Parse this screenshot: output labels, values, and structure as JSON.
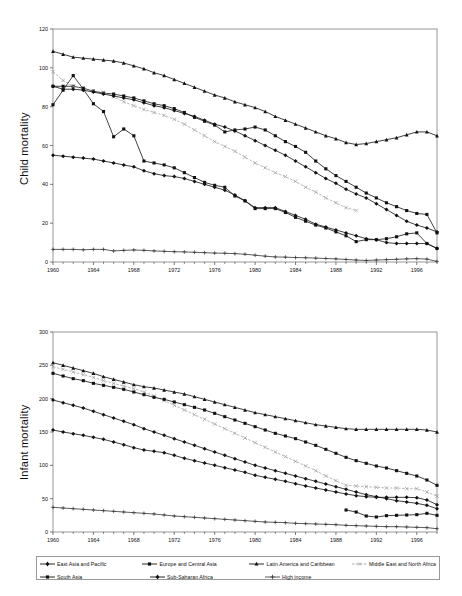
{
  "chart_data": [
    {
      "type": "line",
      "id": "child-mortality",
      "title": "",
      "ylabel": "Child mortality",
      "xlabel": "",
      "ylim": [
        0,
        120
      ],
      "ytick_step": 20,
      "yticks": [
        0,
        20,
        40,
        60,
        80,
        100,
        120
      ],
      "xlim": [
        1960,
        1998
      ],
      "xticks": [
        1960,
        1964,
        1968,
        1972,
        1976,
        1980,
        1984,
        1988,
        1992,
        1996
      ],
      "grid": false,
      "legend_position": "bottom",
      "x": [
        1960,
        1961,
        1962,
        1963,
        1964,
        1965,
        1966,
        1967,
        1968,
        1969,
        1970,
        1971,
        1972,
        1973,
        1974,
        1975,
        1976,
        1977,
        1978,
        1979,
        1980,
        1981,
        1982,
        1983,
        1984,
        1985,
        1986,
        1987,
        1988,
        1989,
        1990,
        1991,
        1992,
        1993,
        1994,
        1995,
        1996,
        1997,
        1998
      ],
      "series": [
        {
          "name": "East Asia and Pacific",
          "marker": "diamond",
          "style": "solid",
          "color": "#111111",
          "values": [
            55,
            54.5,
            54,
            53.5,
            53,
            52,
            51,
            50,
            49,
            47,
            45.5,
            44.5,
            44,
            43,
            41.5,
            40,
            38.5,
            37,
            34.5,
            31.5,
            28,
            28,
            28,
            26,
            24,
            22,
            19.5,
            18,
            16.5,
            15,
            13.5,
            12,
            11.5,
            10,
            9.5,
            9.5,
            9.5,
            9.5,
            7
          ]
        },
        {
          "name": "Europe and Central Asia",
          "marker": "square",
          "style": "solid",
          "color": "#111111",
          "values": [
            90.5,
            90.5,
            90.5,
            89.5,
            88,
            87,
            86.5,
            85.5,
            84.5,
            83,
            81.5,
            80.5,
            79,
            77,
            74.5,
            72.5,
            70.5,
            67,
            68,
            68.5,
            69.5,
            68,
            65,
            62,
            59.5,
            56.5,
            52,
            48,
            44.5,
            41.5,
            38.5,
            35.5,
            33,
            30.5,
            28.5,
            26.5,
            25,
            24.5,
            15
          ]
        },
        {
          "name": "Latin America and Caribbean",
          "marker": "triangle",
          "style": "solid",
          "color": "#111111",
          "values": [
            108.5,
            107,
            105.5,
            105,
            104.5,
            104,
            103.5,
            102.5,
            101,
            99.5,
            97.5,
            96,
            94,
            92,
            90,
            88,
            86,
            84.5,
            82.5,
            81,
            79.5,
            77.5,
            75,
            73,
            71,
            69,
            67,
            65,
            63.5,
            61.5,
            60.5,
            61,
            62,
            63,
            64,
            65.5,
            67,
            67,
            65
          ]
        },
        {
          "name": "Middle East and North Africa",
          "marker": "cross",
          "style": "dashed-light",
          "color": "#9b9b9b",
          "values": [
            98,
            93.5,
            90.5,
            89,
            88,
            87.5,
            85,
            82.5,
            80.5,
            78.5,
            77,
            75.5,
            73.5,
            71,
            68,
            65,
            62,
            59.5,
            57,
            54,
            51,
            48.5,
            46,
            44,
            41.5,
            38.5,
            36,
            33,
            30.5,
            28,
            26.5,
            null,
            null,
            null,
            null,
            null,
            null,
            null,
            null
          ]
        },
        {
          "name": "South Asia",
          "marker": "square",
          "style": "solid",
          "color": "#111111",
          "values": [
            81,
            88.5,
            96,
            89,
            81.5,
            77.5,
            64.5,
            68.5,
            65,
            52,
            51,
            50,
            48.5,
            46,
            43.5,
            41,
            39.5,
            38.5,
            34,
            31.5,
            27.5,
            27.5,
            27.5,
            25.5,
            23,
            21,
            19,
            17.5,
            15.5,
            13.5,
            10.5,
            11.5,
            11.5,
            12,
            13,
            14.5,
            15,
            9.5,
            7
          ]
        },
        {
          "name": "Sub-Saharan Africa",
          "marker": "diamond",
          "style": "solid",
          "color": "#111111",
          "values": [
            90.5,
            89,
            89,
            88.5,
            87.5,
            86.5,
            85.5,
            84.5,
            83.5,
            82,
            80.5,
            79.5,
            78,
            76.5,
            75,
            73,
            71,
            69.5,
            67.5,
            65,
            62.5,
            60,
            57.5,
            55,
            52,
            49,
            46,
            43,
            40.5,
            37.5,
            35,
            33,
            30,
            27,
            24,
            21,
            19,
            17.5,
            15.5
          ]
        },
        {
          "name": "High income",
          "marker": "plus",
          "style": "solid",
          "color": "#333333",
          "values": [
            6.5,
            6.5,
            6.5,
            6.3,
            6.5,
            6.5,
            5.7,
            6,
            6.2,
            6,
            5.7,
            5.5,
            5.3,
            5.2,
            5,
            4.8,
            4.6,
            4.5,
            4.3,
            4,
            3.5,
            3,
            2.6,
            2.5,
            2.3,
            2.2,
            2,
            1.8,
            1.6,
            1.3,
            1,
            0.8,
            1,
            1.2,
            1.4,
            1.6,
            1.7,
            1.5,
            0.3
          ]
        }
      ]
    },
    {
      "type": "line",
      "id": "infant-mortality",
      "title": "",
      "ylabel": "Infant mortality",
      "xlabel": "",
      "ylim": [
        0,
        300
      ],
      "ytick_step": 50,
      "yticks": [
        0,
        50,
        100,
        150,
        200,
        250,
        300
      ],
      "xlim": [
        1960,
        1998
      ],
      "xticks": [
        1960,
        1964,
        1968,
        1972,
        1976,
        1980,
        1984,
        1988,
        1992,
        1996
      ],
      "grid": false,
      "legend_position": "bottom",
      "x": [
        1960,
        1961,
        1962,
        1963,
        1964,
        1965,
        1966,
        1967,
        1968,
        1969,
        1970,
        1971,
        1972,
        1973,
        1974,
        1975,
        1976,
        1977,
        1978,
        1979,
        1980,
        1981,
        1982,
        1983,
        1984,
        1985,
        1986,
        1987,
        1988,
        1989,
        1990,
        1991,
        1992,
        1993,
        1994,
        1995,
        1996,
        1997,
        1998
      ],
      "series": [
        {
          "name": "East Asia and Pacific",
          "marker": "diamond",
          "style": "solid",
          "color": "#111111",
          "values": [
            153,
            150,
            147.5,
            145,
            142,
            139,
            135,
            131,
            126.5,
            123,
            121,
            119,
            115,
            110.5,
            107,
            103.5,
            100,
            96.5,
            93,
            89.5,
            85,
            82,
            79,
            76,
            72.5,
            69,
            66,
            63,
            60,
            57,
            54.5,
            53,
            52,
            52,
            52,
            52,
            51.5,
            48,
            41
          ]
        },
        {
          "name": "Europe and Central Asia",
          "marker": "square",
          "style": "solid",
          "color": "#111111",
          "values": [
            null,
            null,
            null,
            null,
            null,
            null,
            null,
            null,
            null,
            null,
            null,
            null,
            null,
            null,
            null,
            null,
            null,
            null,
            null,
            null,
            null,
            null,
            null,
            null,
            null,
            null,
            null,
            null,
            null,
            33,
            30,
            24,
            22.5,
            24.5,
            25,
            25.5,
            26,
            28,
            25
          ]
        },
        {
          "name": "Latin America and Caribbean",
          "marker": "triangle",
          "style": "solid",
          "color": "#111111",
          "values": [
            254,
            250,
            246,
            242,
            238,
            233,
            229,
            225,
            221,
            218,
            216,
            213,
            210,
            207,
            203,
            199,
            195,
            191,
            187,
            183,
            179,
            176,
            173,
            170,
            167,
            164,
            161,
            159,
            157,
            155,
            154,
            154,
            154,
            154,
            154,
            154,
            154,
            153,
            150
          ]
        },
        {
          "name": "Middle East and North Africa",
          "marker": "cross",
          "style": "dashed-light",
          "color": "#9b9b9b",
          "values": [
            248,
            244,
            240,
            236,
            232,
            227,
            223,
            219,
            215,
            210,
            204,
            197,
            190,
            183,
            176,
            169,
            162,
            155,
            148,
            141,
            134,
            127,
            120,
            113,
            106,
            99,
            92,
            84,
            77,
            70,
            69,
            68,
            67,
            66,
            66,
            65,
            65,
            60,
            54
          ]
        },
        {
          "name": "South Asia",
          "marker": "square",
          "style": "solid",
          "color": "#111111",
          "values": [
            238,
            234,
            230,
            227,
            223,
            220,
            217,
            214,
            210,
            206,
            202,
            199,
            195,
            191,
            187,
            183,
            178,
            173,
            168,
            163,
            158,
            153,
            148,
            144,
            140,
            135,
            130,
            124,
            118,
            112,
            107,
            103,
            99,
            96,
            92,
            88,
            84,
            78,
            70
          ]
        },
        {
          "name": "Sub-Saharan Africa",
          "marker": "diamond",
          "style": "solid",
          "color": "#111111",
          "values": [
            198,
            194,
            190,
            186,
            181,
            176,
            171,
            166,
            161,
            155,
            150,
            145,
            140,
            135,
            130,
            125,
            120,
            115,
            110,
            105,
            100,
            96,
            92,
            88,
            84,
            80,
            76,
            72,
            68,
            64,
            60,
            56,
            53,
            50,
            47,
            45,
            43,
            40,
            35
          ]
        },
        {
          "name": "High income",
          "marker": "plus",
          "style": "solid",
          "color": "#333333",
          "values": [
            37,
            36,
            35,
            34,
            33,
            32,
            31,
            30,
            29,
            28,
            27,
            25.5,
            24,
            23,
            22,
            21,
            20,
            19,
            18,
            17,
            16,
            15,
            14.5,
            14,
            13,
            12.5,
            12,
            11.5,
            11,
            10,
            9.5,
            9,
            8.5,
            8,
            8,
            7.5,
            7,
            6.5,
            5
          ]
        }
      ]
    }
  ],
  "legend": {
    "items": [
      {
        "label": "East Asia and Pacific",
        "marker": "diamond",
        "style": "solid",
        "color": "#111111"
      },
      {
        "label": "Europe and Central Asia",
        "marker": "square",
        "style": "solid",
        "color": "#111111"
      },
      {
        "label": "Latin America and Caribbean",
        "marker": "triangle",
        "style": "solid",
        "color": "#111111"
      },
      {
        "label": "Middle East and North Africa",
        "marker": "cross",
        "style": "dashed-light",
        "color": "#9b9b9b"
      },
      {
        "label": "South Asia",
        "marker": "square",
        "style": "solid",
        "color": "#111111"
      },
      {
        "label": "Sub-Saharan Africa",
        "marker": "diamond",
        "style": "solid",
        "color": "#111111"
      },
      {
        "label": "High income",
        "marker": "plus",
        "style": "solid",
        "color": "#333333"
      }
    ]
  },
  "axis_titles": {
    "top": "Child mortality",
    "bottom": "Infant mortality"
  }
}
